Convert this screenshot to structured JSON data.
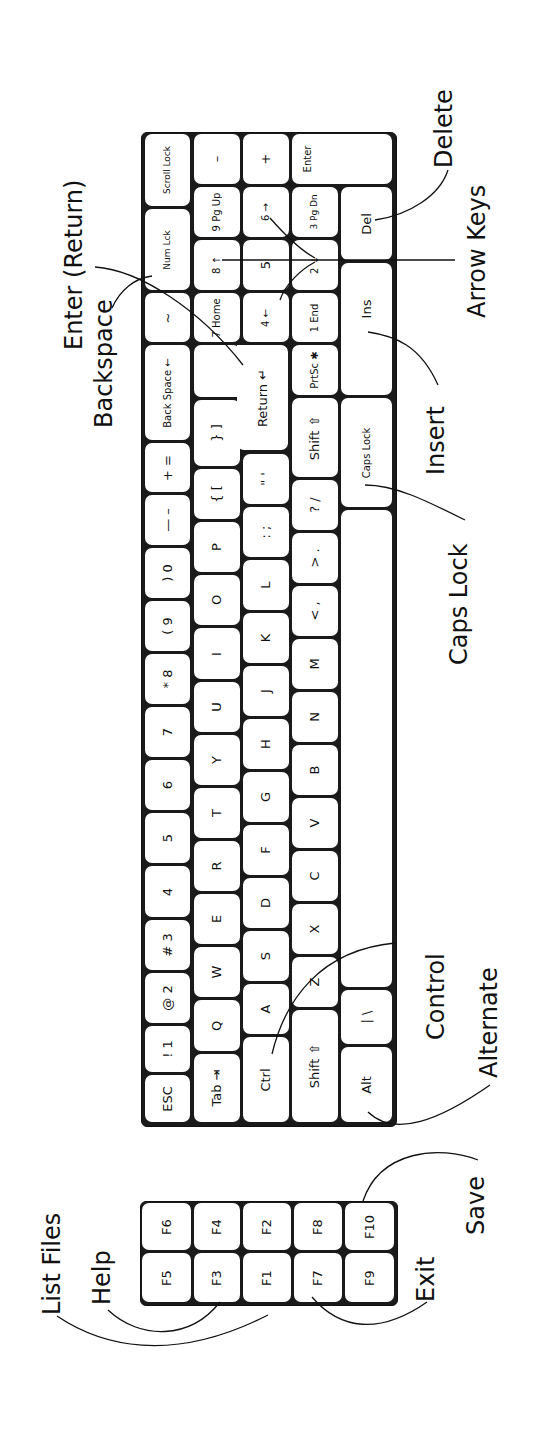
{
  "diagram": {
    "orientation": "rotated 90° counter-clockwise",
    "colors": {
      "ink": "#111111",
      "key_fill": "#ffffff",
      "background": "#ffffff"
    }
  },
  "keyboard": {
    "col_a": [
      {
        "id": "esc",
        "label": "ESC"
      },
      {
        "id": "1",
        "label": "! 1"
      },
      {
        "id": "2",
        "label": "@ 2"
      },
      {
        "id": "3",
        "label": "# 3"
      },
      {
        "id": "4",
        "label": "4"
      },
      {
        "id": "5",
        "label": "5"
      },
      {
        "id": "6",
        "label": "6"
      },
      {
        "id": "7",
        "label": "7"
      },
      {
        "id": "8",
        "label": "* 8"
      },
      {
        "id": "9",
        "label": "( 9"
      },
      {
        "id": "0",
        "label": ") 0"
      },
      {
        "id": "minus",
        "label": "— –"
      },
      {
        "id": "equals",
        "label": "+ ="
      },
      {
        "id": "backspace",
        "label": "Back Space ←"
      },
      {
        "id": "tilde",
        "label": "~"
      },
      {
        "id": "scrolllock",
        "label": "Scroll Lock"
      }
    ],
    "col_b": [
      {
        "id": "tab",
        "label": "Tab ⇥"
      },
      {
        "id": "q",
        "label": "Q"
      },
      {
        "id": "w",
        "label": "W"
      },
      {
        "id": "e",
        "label": "E"
      },
      {
        "id": "r",
        "label": "R"
      },
      {
        "id": "t",
        "label": "T"
      },
      {
        "id": "y",
        "label": "Y"
      },
      {
        "id": "u",
        "label": "U"
      },
      {
        "id": "i",
        "label": "I"
      },
      {
        "id": "o",
        "label": "O"
      },
      {
        "id": "p",
        "label": "P"
      },
      {
        "id": "lbracket",
        "label": "{ ["
      },
      {
        "id": "rbracket",
        "label": "} ]"
      },
      {
        "id": "num7",
        "label": "7 Home"
      },
      {
        "id": "num8",
        "label": "8 ↑"
      },
      {
        "id": "num9",
        "label": "9 Pg Up"
      },
      {
        "id": "numminus",
        "label": "–"
      }
    ],
    "col_c": [
      {
        "id": "ctrl",
        "label": "Ctrl"
      },
      {
        "id": "a",
        "label": "A"
      },
      {
        "id": "s",
        "label": "S"
      },
      {
        "id": "d",
        "label": "D"
      },
      {
        "id": "f",
        "label": "F"
      },
      {
        "id": "g",
        "label": "G"
      },
      {
        "id": "h",
        "label": "H"
      },
      {
        "id": "j",
        "label": "J"
      },
      {
        "id": "k",
        "label": "K"
      },
      {
        "id": "l",
        "label": "L"
      },
      {
        "id": "semicolon",
        "label": ": ;"
      },
      {
        "id": "quote",
        "label": "\" '"
      },
      {
        "id": "return",
        "label": "Return ↵"
      },
      {
        "id": "num4",
        "label": "4 ←"
      },
      {
        "id": "num5",
        "label": "5"
      },
      {
        "id": "num6",
        "label": "6 →"
      },
      {
        "id": "numplus",
        "label": "+"
      }
    ],
    "col_d": [
      {
        "id": "lshift",
        "label": "Shift ⇧"
      },
      {
        "id": "z",
        "label": "Z"
      },
      {
        "id": "x",
        "label": "X"
      },
      {
        "id": "c",
        "label": "C"
      },
      {
        "id": "v",
        "label": "V"
      },
      {
        "id": "b",
        "label": "B"
      },
      {
        "id": "n",
        "label": "N"
      },
      {
        "id": "m",
        "label": "M"
      },
      {
        "id": "comma",
        "label": "< ,"
      },
      {
        "id": "period",
        "label": "> ."
      },
      {
        "id": "slash",
        "label": "? /"
      },
      {
        "id": "rshift",
        "label": "Shift ⇧"
      },
      {
        "id": "prtsc",
        "label": "PrtSc ✱"
      },
      {
        "id": "num1",
        "label": "1 End"
      },
      {
        "id": "num2",
        "label": "2 ↓"
      },
      {
        "id": "num3",
        "label": "3 Pg Dn"
      },
      {
        "id": "numenter",
        "label": "Enter"
      }
    ],
    "col_e": [
      {
        "id": "alt",
        "label": "Alt"
      },
      {
        "id": "backslash",
        "label": "| \\"
      },
      {
        "id": "space",
        "label": ""
      },
      {
        "id": "capslock",
        "label": "Caps Lock"
      },
      {
        "id": "ins",
        "label": "Ins"
      },
      {
        "id": "del",
        "label": "Del"
      }
    ],
    "numlock": {
      "id": "numlock",
      "label": "Num Lck"
    }
  },
  "function_keys": [
    {
      "id": "f1",
      "label": "F1"
    },
    {
      "id": "f2",
      "label": "F2"
    },
    {
      "id": "f3",
      "label": "F3"
    },
    {
      "id": "f4",
      "label": "F4"
    },
    {
      "id": "f5",
      "label": "F5"
    },
    {
      "id": "f6",
      "label": "F6"
    },
    {
      "id": "f7",
      "label": "F7"
    },
    {
      "id": "f8",
      "label": "F8"
    },
    {
      "id": "f9",
      "label": "F9"
    },
    {
      "id": "f10",
      "label": "F10"
    }
  ],
  "callouts": {
    "enter_return": "Enter (Return)",
    "backspace": "Backspace",
    "delete": "Delete",
    "arrow_keys": "Arrow Keys",
    "insert": "Insert",
    "caps_lock": "Caps Lock",
    "control": "Control",
    "alternate": "Alternate",
    "list_files": "List Files",
    "help": "Help",
    "exit": "Exit",
    "save": "Save"
  }
}
